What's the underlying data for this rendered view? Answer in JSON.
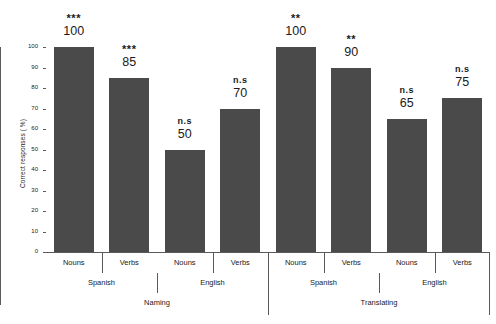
{
  "chart_data": {
    "type": "bar",
    "title": "",
    "xlabel": "",
    "ylabel": "Correct responses ( %)",
    "ylim": [
      0,
      100
    ],
    "yticks": [
      0,
      10,
      20,
      30,
      40,
      50,
      60,
      70,
      80,
      90,
      100
    ],
    "grid": false,
    "legend": null,
    "categories": [
      "Naming / Spanish / Nouns",
      "Naming / Spanish / Verbs",
      "Naming / English / Nouns",
      "Naming / English / Verbs",
      "Translating / Spanish / Nouns",
      "Translating / Spanish / Verbs",
      "Translating / English / Nouns",
      "Translating / English / Verbs"
    ],
    "values": [
      100,
      85,
      50,
      70,
      100,
      90,
      65,
      75
    ],
    "annotations": [
      "***",
      "***",
      "n.s",
      "n.s",
      "**",
      "**",
      "n.s",
      "n.s"
    ],
    "bar_color": "#4a4a4a",
    "axis_color": "#5a5a5a",
    "background": "#ffffff"
  },
  "bars": [
    {
      "value": "100",
      "sig": "***",
      "sig_type": "stars",
      "label": "Nouns"
    },
    {
      "value": "85",
      "sig": "***",
      "sig_type": "stars",
      "label": "Verbs"
    },
    {
      "value": "50",
      "sig": "n.s",
      "sig_type": "text",
      "label": "Nouns"
    },
    {
      "value": "70",
      "sig": "n.s",
      "sig_type": "text",
      "label": "Verbs"
    },
    {
      "value": "100",
      "sig": "**",
      "sig_type": "stars",
      "label": "Nouns"
    },
    {
      "value": "90",
      "sig": "**",
      "sig_type": "stars",
      "label": "Verbs"
    },
    {
      "value": "65",
      "sig": "n.s",
      "sig_type": "text",
      "label": "Nouns"
    },
    {
      "value": "75",
      "sig": "n.s",
      "sig_type": "text",
      "label": "Verbs"
    }
  ],
  "yaxis": {
    "title": "Correct responses ( %)",
    "ticks": [
      "100",
      "90",
      "80",
      "70",
      "60",
      "50",
      "40",
      "30",
      "20",
      "10",
      "0"
    ]
  },
  "groups_language": [
    {
      "label": "Spanish"
    },
    {
      "label": "English"
    },
    {
      "label": "Spanish"
    },
    {
      "label": "English"
    }
  ],
  "groups_task": [
    {
      "label": "Naming"
    },
    {
      "label": "Translating"
    }
  ]
}
